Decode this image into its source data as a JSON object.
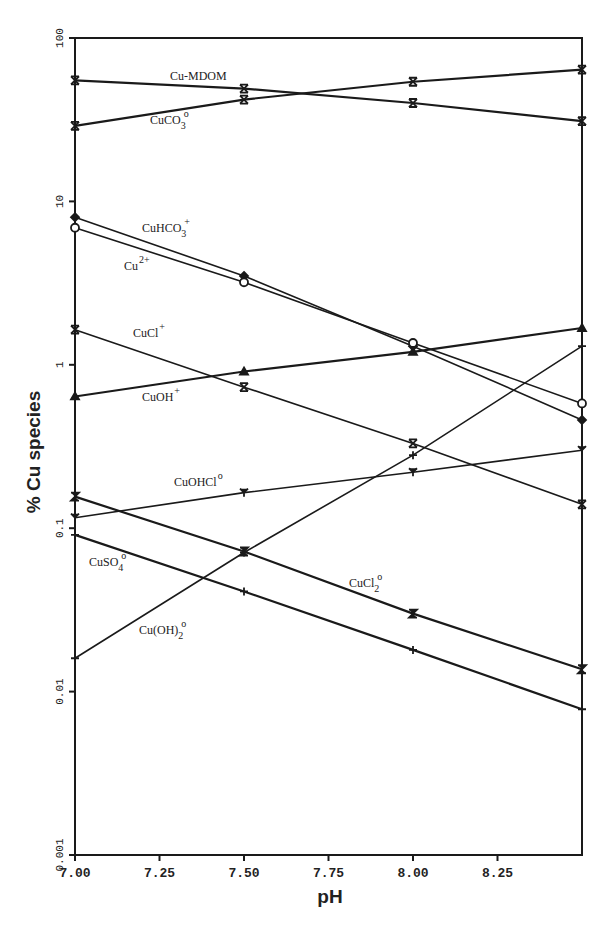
{
  "chart_data": {
    "type": "line",
    "title": "",
    "xlabel": "pH",
    "ylabel": "% Cu species",
    "yscale": "log",
    "xlim": [
      7.0,
      8.5
    ],
    "ylim": [
      0.001,
      100
    ],
    "grid": false,
    "legend": "inline labels",
    "x": [
      7.0,
      7.5,
      8.0,
      8.5
    ],
    "x_tick_labels": [
      "7.00",
      "7.25",
      "7.50",
      "7.75",
      "8.00",
      "8.25"
    ],
    "x_ticks": [
      7.0,
      7.25,
      7.5,
      7.75,
      8.0,
      8.25
    ],
    "y_tick_labels": [
      "100",
      "10",
      "1",
      "0.1",
      "0.01",
      "0.001"
    ],
    "y_ticks": [
      100,
      10,
      1,
      0.1,
      0.01,
      0.001
    ],
    "series": [
      {
        "name": "Cu-MDOM",
        "label_main": "Cu-MDOM",
        "label_sub": "",
        "label_sup": "",
        "marker": "x-cross",
        "values": [
          55,
          49,
          40,
          31
        ],
        "label_pos": [
          170,
          80
        ]
      },
      {
        "name": "CuCO3°",
        "label_main": "CuCO",
        "label_sub": "3",
        "label_sup": "o",
        "marker": "x-cross",
        "values": [
          29,
          42,
          54,
          64
        ],
        "label_pos": [
          150,
          124
        ]
      },
      {
        "name": "CuHCO3+",
        "label_main": "CuHCO",
        "label_sub": "3",
        "label_sup": "+",
        "marker": "diamond",
        "values": [
          8.0,
          3.5,
          1.3,
          0.46
        ],
        "label_pos": [
          142,
          232
        ]
      },
      {
        "name": "Cu2+",
        "label_main": "Cu",
        "label_sub": "",
        "label_sup": "2+",
        "marker": "circle-open",
        "values": [
          6.9,
          3.2,
          1.36,
          0.58
        ],
        "label_pos": [
          124,
          270
        ]
      },
      {
        "name": "CuCl+",
        "label_main": "CuCl",
        "label_sub": "",
        "label_sup": "+",
        "marker": "x-cross",
        "values": [
          1.64,
          0.73,
          0.33,
          0.14
        ],
        "label_pos": [
          133,
          337
        ]
      },
      {
        "name": "CuOH+",
        "label_main": "CuOH",
        "label_sub": "",
        "label_sup": "+",
        "marker": "triangle",
        "values": [
          0.64,
          0.91,
          1.2,
          1.68
        ],
        "label_pos": [
          142,
          401
        ]
      },
      {
        "name": "CuOHCl°",
        "label_main": "CuOHCl",
        "label_sub": "",
        "label_sup": "o",
        "marker": "y-mark",
        "values": [
          0.116,
          0.165,
          0.22,
          0.3
        ],
        "label_pos": [
          174,
          486
        ]
      },
      {
        "name": "CuCl2°",
        "label_main": "CuCl",
        "label_sub": "2",
        "label_sup": "o",
        "marker": "z-mark",
        "values": [
          0.156,
          0.072,
          0.03,
          0.0137
        ],
        "label_pos": [
          349,
          587
        ]
      },
      {
        "name": "CuSO4°",
        "label_main": "CuSO",
        "label_sub": "4",
        "label_sup": "o",
        "marker": "plus",
        "values": [
          0.091,
          0.041,
          0.018,
          0.0078
        ],
        "label_pos": [
          89,
          566
        ]
      },
      {
        "name": "Cu(OH)2°",
        "label_main": "Cu(OH)",
        "label_sub": "2",
        "label_sup": "o",
        "marker": "plus",
        "values": [
          0.016,
          0.071,
          0.28,
          1.3
        ],
        "label_pos": [
          139,
          634
        ]
      }
    ]
  }
}
